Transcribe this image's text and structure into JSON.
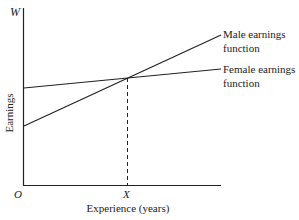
{
  "diagram": {
    "type": "line",
    "axes": {
      "y_axis_symbol": "W",
      "y_label": "Earnings",
      "origin_label": "O",
      "x_marker_label": "X",
      "x_label": "Experience (years)"
    },
    "series": [
      {
        "name": "Male earnings function",
        "label_line1": "Male earnings",
        "label_line2": "function",
        "start": [
          0,
          0.35
        ],
        "end": [
          1,
          0.97
        ]
      },
      {
        "name": "Female earnings function",
        "label_line1": "Female earnings",
        "label_line2": "function",
        "start": [
          0,
          0.63
        ],
        "end": [
          1,
          0.79
        ]
      }
    ],
    "intersection": {
      "label": "X",
      "dashed_drop": true
    }
  }
}
